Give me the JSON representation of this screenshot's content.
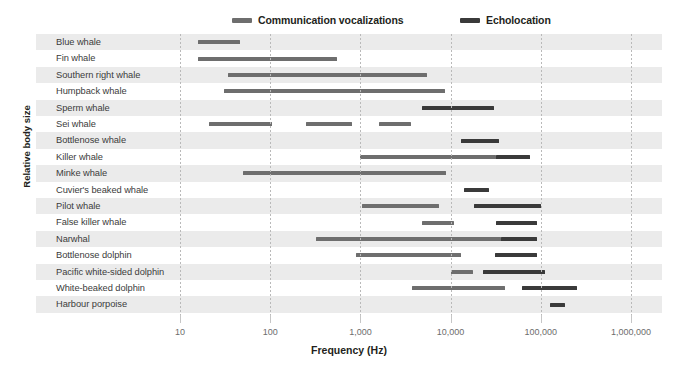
{
  "legend": {
    "position": "top",
    "entries": [
      {
        "label": "Communication vocalizations",
        "color": "#6e6e6e",
        "x_px": 232
      },
      {
        "label": "Echolocation",
        "color": "#3a3a3a",
        "x_px": 460
      }
    ]
  },
  "axes": {
    "y_title": "Relative body size",
    "x_title": "Frequency (Hz)",
    "x_scale": "log",
    "x_ticks": [
      {
        "value": 10,
        "label": "10"
      },
      {
        "value": 100,
        "label": "100"
      },
      {
        "value": 1000,
        "label": "1,000"
      },
      {
        "value": 10000,
        "label": "10,000"
      },
      {
        "value": 100000,
        "label": "100,000"
      },
      {
        "value": 1000000,
        "label": "1,000,000"
      }
    ],
    "xlim": [
      4.0,
      2150000
    ]
  },
  "colors": {
    "communication": "#6e6e6e",
    "echolocation": "#3a3a3a",
    "row_stripe": "#ebebeb",
    "gridline": "#b9b9b9",
    "label_text": "#3b3b3b",
    "tick_text": "#6d6d6d",
    "title_text": "#231f20",
    "background": "#ffffff"
  },
  "chart_data": {
    "type": "bar",
    "orientation": "horizontal",
    "title": "",
    "subtitle": "",
    "xlabel": "Frequency (Hz)",
    "ylabel": "Relative body size",
    "xscale": "log",
    "xlim": [
      4.0,
      2150000
    ],
    "grid": true,
    "legend_position": "top",
    "note": "Each row is a species; horizontal range bars span the min-max frequency (Hz) of each call type. Species are ordered by decreasing relative body size (top = largest).",
    "series": [
      {
        "name": "Communication vocalizations",
        "color": "#6e6e6e"
      },
      {
        "name": "Echolocation",
        "color": "#3a3a3a"
      }
    ],
    "categories": [
      "Blue whale",
      "Fin whale",
      "Southern right whale",
      "Humpback whale",
      "Sperm whale",
      "Sei whale",
      "Bottlenose whale",
      "Killer whale",
      "Minke whale",
      "Cuvier's beaked whale",
      "Pilot whale",
      "False killer whale",
      "Narwhal",
      "Bottlenose dolphin",
      "Pacific white-sided dolphin",
      "White-beaked dolphin",
      "Harbour porpoise"
    ],
    "rows": [
      {
        "species": "Blue whale",
        "bars": [
          {
            "series": "Communication vocalizations",
            "from": 16,
            "to": 46
          }
        ]
      },
      {
        "species": "Fin whale",
        "bars": [
          {
            "series": "Communication vocalizations",
            "from": 16,
            "to": 550
          }
        ]
      },
      {
        "species": "Southern right whale",
        "bars": [
          {
            "series": "Communication vocalizations",
            "from": 34,
            "to": 5500
          }
        ]
      },
      {
        "species": "Humpback whale",
        "bars": [
          {
            "series": "Communication vocalizations",
            "from": 31,
            "to": 8600
          }
        ]
      },
      {
        "species": "Sperm whale",
        "bars": [
          {
            "series": "Echolocation",
            "from": 4800,
            "to": 30000
          }
        ]
      },
      {
        "species": "Sei whale",
        "bars": [
          {
            "series": "Communication vocalizations",
            "from": 21,
            "to": 105
          },
          {
            "series": "Communication vocalizations",
            "from": 250,
            "to": 800
          },
          {
            "series": "Communication vocalizations",
            "from": 1600,
            "to": 3600
          }
        ]
      },
      {
        "species": "Bottlenose whale",
        "bars": [
          {
            "series": "Echolocation",
            "from": 13000,
            "to": 34000
          }
        ]
      },
      {
        "species": "Killer whale",
        "bars": [
          {
            "series": "Communication vocalizations",
            "from": 1000,
            "to": 32000
          },
          {
            "series": "Echolocation",
            "from": 32000,
            "to": 75000
          }
        ]
      },
      {
        "species": "Minke whale",
        "bars": [
          {
            "series": "Communication vocalizations",
            "from": 50,
            "to": 8800
          }
        ]
      },
      {
        "species": "Cuvier's beaked whale",
        "bars": [
          {
            "series": "Echolocation",
            "from": 14000,
            "to": 27000
          }
        ]
      },
      {
        "species": "Pilot whale",
        "bars": [
          {
            "series": "Communication vocalizations",
            "from": 1050,
            "to": 7500
          },
          {
            "series": "Echolocation",
            "from": 18000,
            "to": 100000
          }
        ]
      },
      {
        "species": "False killer whale",
        "bars": [
          {
            "series": "Communication vocalizations",
            "from": 4800,
            "to": 11000
          },
          {
            "series": "Echolocation",
            "from": 32000,
            "to": 90000
          }
        ]
      },
      {
        "species": "Narwhal",
        "bars": [
          {
            "series": "Communication vocalizations",
            "from": 320,
            "to": 36000
          },
          {
            "series": "Echolocation",
            "from": 36000,
            "to": 90000
          }
        ]
      },
      {
        "species": "Bottlenose dolphin",
        "bars": [
          {
            "series": "Communication vocalizations",
            "from": 900,
            "to": 13000
          },
          {
            "series": "Echolocation",
            "from": 31000,
            "to": 90000
          }
        ]
      },
      {
        "species": "Pacific white-sided dolphin",
        "bars": [
          {
            "series": "Communication vocalizations",
            "from": 10000,
            "to": 17500
          },
          {
            "series": "Echolocation",
            "from": 23000,
            "to": 110000
          }
        ]
      },
      {
        "species": "White-beaked dolphin",
        "bars": [
          {
            "series": "Communication vocalizations",
            "from": 3700,
            "to": 40000
          },
          {
            "series": "Echolocation",
            "from": 62000,
            "to": 250000
          }
        ]
      },
      {
        "species": "Harbour porpoise",
        "bars": [
          {
            "series": "Echolocation",
            "from": 125000,
            "to": 185000
          }
        ]
      }
    ]
  }
}
